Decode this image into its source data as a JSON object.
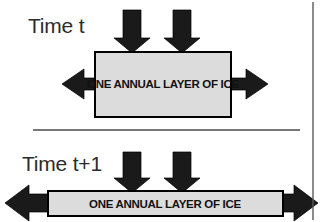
{
  "figure": {
    "background_color": "#ffffff",
    "width": 327,
    "height": 222
  },
  "colors": {
    "ice_fill": "#dcdcdc",
    "ice_border": "#000000",
    "arrow_fill": "#1a1a1a",
    "label_text": "#2b2b2b",
    "box_text": "#111111",
    "divider": "#4a4a4a",
    "frame": "#5a5a5a"
  },
  "panels": [
    {
      "id": "time-t",
      "time_label": "Time t",
      "box_label": "ONE ANNUAL LAYER OF ICE",
      "load_arrows": 2,
      "spread_arrows": 2,
      "box": {
        "x": 95,
        "y": 52,
        "width": 136,
        "height": 65
      },
      "down_arrows": [
        {
          "cx": 132,
          "top": 10,
          "tip_y": 52
        },
        {
          "cx": 182,
          "top": 10,
          "tip_y": 52
        }
      ],
      "left_arrow": {
        "tip_x": 62,
        "y": 84
      },
      "right_arrow": {
        "tip_x": 268,
        "y": 84
      }
    },
    {
      "id": "time-t-plus-1",
      "time_label": "Time t+1",
      "box_label": "ONE ANNUAL LAYER OF ICE",
      "load_arrows": 2,
      "spread_arrows": 2,
      "box": {
        "x": 48,
        "y": 191,
        "width": 235,
        "height": 25
      },
      "down_arrows": [
        {
          "cx": 132,
          "top": 152,
          "tip_y": 192
        },
        {
          "cx": 182,
          "top": 152,
          "tip_y": 192
        }
      ],
      "left_arrow": {
        "tip_x": 5,
        "y": 203
      },
      "right_arrow": {
        "tip_x": 318,
        "y": 203
      }
    }
  ],
  "divider": {
    "x1": 33,
    "x2": 300,
    "y": 130
  },
  "frame_right_line": {
    "x": 313,
    "y1": 2,
    "y2": 220
  }
}
